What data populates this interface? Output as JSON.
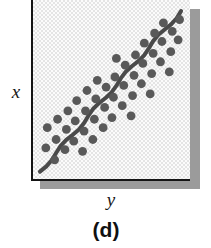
{
  "figure": {
    "caption": "(d)",
    "x_axis_label": "x",
    "y_axis_label": "y",
    "panel_background": "#e4e4e4",
    "axis_color": "#141414",
    "shadow_color": "#9b9b9b",
    "marker_color": "#595959",
    "trend_line_color": "#4a4a4a"
  },
  "chart_data": {
    "type": "scatter",
    "title": "(d)",
    "xlabel": "y",
    "ylabel": "x",
    "grid": false,
    "legend": null,
    "xlim": [
      0,
      100
    ],
    "ylim": [
      0,
      100
    ],
    "note": "Strong positive linear association: points form a tight band around a rising diagonal trend line.",
    "trend_line": {
      "style": "solid-thick-wavy",
      "x": [
        2,
        98
      ],
      "y": [
        2,
        97
      ]
    },
    "points": [
      {
        "x": 6,
        "y": 16
      },
      {
        "x": 7,
        "y": 28
      },
      {
        "x": 12,
        "y": 9
      },
      {
        "x": 13,
        "y": 21
      },
      {
        "x": 14,
        "y": 33
      },
      {
        "x": 19,
        "y": 15
      },
      {
        "x": 20,
        "y": 27
      },
      {
        "x": 21,
        "y": 38
      },
      {
        "x": 25,
        "y": 20
      },
      {
        "x": 26,
        "y": 32
      },
      {
        "x": 27,
        "y": 44
      },
      {
        "x": 31,
        "y": 14
      },
      {
        "x": 32,
        "y": 26
      },
      {
        "x": 33,
        "y": 38
      },
      {
        "x": 34,
        "y": 50
      },
      {
        "x": 38,
        "y": 21
      },
      {
        "x": 39,
        "y": 33
      },
      {
        "x": 40,
        "y": 45
      },
      {
        "x": 41,
        "y": 56
      },
      {
        "x": 45,
        "y": 28
      },
      {
        "x": 46,
        "y": 40
      },
      {
        "x": 47,
        "y": 52
      },
      {
        "x": 51,
        "y": 34
      },
      {
        "x": 52,
        "y": 46
      },
      {
        "x": 53,
        "y": 58
      },
      {
        "x": 54,
        "y": 69
      },
      {
        "x": 58,
        "y": 41
      },
      {
        "x": 59,
        "y": 53
      },
      {
        "x": 60,
        "y": 65
      },
      {
        "x": 64,
        "y": 35
      },
      {
        "x": 65,
        "y": 47
      },
      {
        "x": 66,
        "y": 59
      },
      {
        "x": 67,
        "y": 71
      },
      {
        "x": 71,
        "y": 54
      },
      {
        "x": 72,
        "y": 66
      },
      {
        "x": 73,
        "y": 78
      },
      {
        "x": 77,
        "y": 48
      },
      {
        "x": 78,
        "y": 60
      },
      {
        "x": 79,
        "y": 72
      },
      {
        "x": 80,
        "y": 84
      },
      {
        "x": 84,
        "y": 67
      },
      {
        "x": 85,
        "y": 79
      },
      {
        "x": 86,
        "y": 90
      },
      {
        "x": 90,
        "y": 61
      },
      {
        "x": 91,
        "y": 73
      },
      {
        "x": 92,
        "y": 85
      },
      {
        "x": 96,
        "y": 80
      },
      {
        "x": 97,
        "y": 92
      }
    ]
  }
}
